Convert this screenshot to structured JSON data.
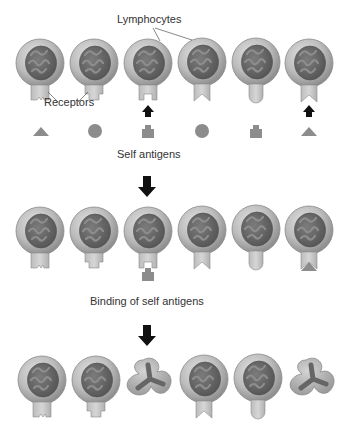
{
  "labels": {
    "lymphocytes": "Lymphocytes",
    "receptors": "Receptors",
    "self_antigens": "Self antigens",
    "binding": "Binding of self antigens"
  },
  "colors": {
    "cell_outer": "#b8b8b8",
    "cell_edge": "#8a8a8a",
    "nucleus": "#6a6a6a",
    "nucleus_swirl": "#8e8e8e",
    "receptor": "#c6c6c6",
    "antigen": "#8c8c8c",
    "arrow": "#111111"
  },
  "stages": [
    {
      "name": "initial",
      "cells": [
        {
          "receptor": "notch-small",
          "state": "alive"
        },
        {
          "receptor": "square-socket",
          "state": "alive"
        },
        {
          "receptor": "square-socket-wide",
          "state": "alive"
        },
        {
          "receptor": "v-notch",
          "state": "alive"
        },
        {
          "receptor": "round",
          "state": "alive"
        },
        {
          "receptor": "v-notch",
          "state": "alive"
        }
      ],
      "antigens": [
        "triangle",
        "circle",
        "block",
        "circle",
        "block",
        "triangle"
      ],
      "binding_arrows_at": [
        2,
        5
      ]
    },
    {
      "name": "binding",
      "cells": [
        {
          "receptor": "notch-small",
          "state": "alive"
        },
        {
          "receptor": "square-socket",
          "state": "alive"
        },
        {
          "receptor": "square-socket-wide",
          "state": "bound",
          "antigen": "block"
        },
        {
          "receptor": "v-notch",
          "state": "alive"
        },
        {
          "receptor": "round",
          "state": "alive"
        },
        {
          "receptor": "v-notch",
          "state": "bound",
          "antigen": "triangle"
        }
      ]
    },
    {
      "name": "result",
      "cells": [
        {
          "receptor": "notch-small",
          "state": "alive"
        },
        {
          "receptor": "square-socket",
          "state": "alive"
        },
        {
          "receptor": "none",
          "state": "dead"
        },
        {
          "receptor": "v-notch",
          "state": "alive"
        },
        {
          "receptor": "round",
          "state": "alive"
        },
        {
          "receptor": "none",
          "state": "dead"
        }
      ]
    }
  ]
}
